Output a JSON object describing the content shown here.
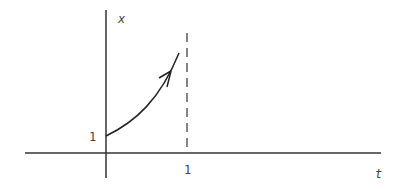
{
  "diagram": {
    "axes": {
      "x_label": "t",
      "y_label": "x"
    },
    "ticks": {
      "y_tick_label": "1",
      "x_tick_label": "1"
    },
    "curve": {
      "description": "increasing convex curve starting at (0,1) with arrow, blowing up toward t=1",
      "color": "#222222"
    },
    "asymptote": {
      "position": "t = 1",
      "style": "dashed"
    }
  }
}
